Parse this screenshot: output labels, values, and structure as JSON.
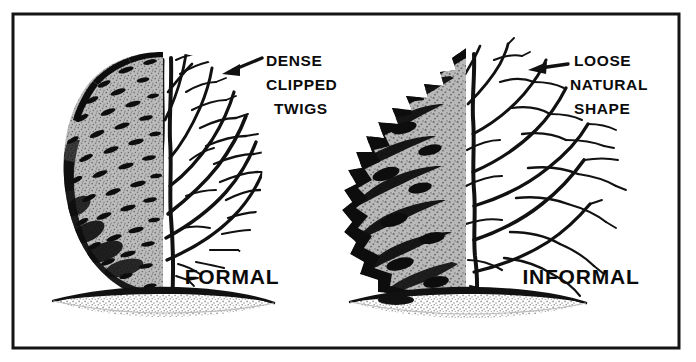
{
  "figure": {
    "kind": "line-drawing-comparison",
    "background_color": "#ffffff",
    "ink_color": "#111111",
    "border": {
      "name": "figure-frame",
      "x": 13,
      "y": 14,
      "width": 666,
      "height": 334,
      "stroke_color": "#141414",
      "stroke_width": 3
    }
  },
  "annotations": {
    "left": {
      "name": "dense-clipped-twigs-callout",
      "lines": [
        "DENSE",
        "CLIPPED",
        "TWIGS"
      ],
      "text_anchor_x": 266,
      "first_line_y": 66,
      "line_height": 24,
      "arrow": {
        "from_x": 262,
        "from_y": 58,
        "to_x": 222,
        "to_y": 74,
        "color": "#111111"
      }
    },
    "right": {
      "name": "loose-natural-shape-callout",
      "lines": [
        "LOOSE",
        "NATURAL",
        "SHAPE"
      ],
      "text_anchor_x": 574,
      "first_line_y": 66,
      "line_height": 24,
      "arrow": {
        "from_x": 568,
        "from_y": 64,
        "to_x": 528,
        "to_y": 70,
        "color": "#111111"
      }
    }
  },
  "captions": {
    "left": {
      "name": "formal-caption",
      "label": "FORMAL",
      "x": 232,
      "y": 284
    },
    "right": {
      "name": "informal-caption",
      "label": "INFORMAL",
      "x": 513,
      "y": 284
    }
  },
  "shrubs": [
    {
      "name": "formal-shrub",
      "caption": "FORMAL",
      "silhouette": "smooth-egg-oval",
      "foliage_texture": "fine-even-stipple-with-short-dashes",
      "branching": "dense-uniform-clipped-twigs",
      "center_x": 163,
      "top_y": 52,
      "bottom_y": 302,
      "foliage_fill": "#b3b3b3",
      "ground": {
        "name": "ground-mound-left",
        "center_x": 163,
        "y": 300,
        "half_width": 110,
        "top_color": "#111111",
        "shade_color": "#c2c2c2"
      }
    },
    {
      "name": "informal-shrub",
      "caption": "INFORMAL",
      "silhouette": "irregular-ragged-natural",
      "foliage_texture": "layered-sweeping-bands",
      "branching": "open-airy-spreading",
      "center_x": 468,
      "top_y": 48,
      "bottom_y": 302,
      "foliage_fill": "#b3b3b3",
      "ground": {
        "name": "ground-mound-right",
        "center_x": 468,
        "y": 300,
        "half_width": 118,
        "top_color": "#111111",
        "shade_color": "#c2c2c2"
      }
    }
  ]
}
